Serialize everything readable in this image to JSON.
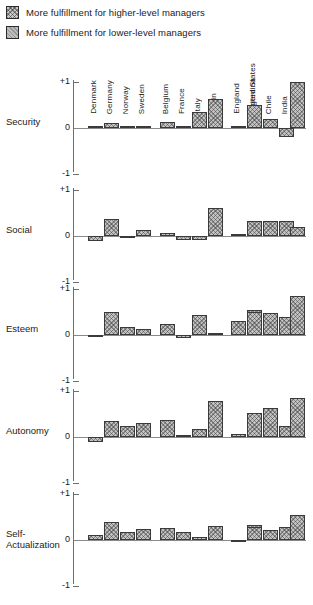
{
  "legend": {
    "items": [
      {
        "label": "More fulfillment for higher-level managers",
        "swatch": "hatched-swatch-higher"
      },
      {
        "label": "More fulfillment for lower-level managers",
        "swatch": "hatched-swatch-lower"
      }
    ]
  },
  "chart_data": {
    "type": "bar",
    "title": "",
    "xlabel": "",
    "ylabel": "",
    "ylim": [
      -1,
      1
    ],
    "grid": false,
    "legend_position": "top-left",
    "tick_labels": [
      "+1",
      "0",
      "-1"
    ],
    "country_groups": [
      {
        "name": "Northern Europe",
        "countries": [
          "Denmark",
          "Germany",
          "Norway",
          "Sweden"
        ]
      },
      {
        "name": "Latin Europe",
        "countries": [
          "Belgium",
          "France",
          "Italy",
          "Spain"
        ]
      },
      {
        "name": "Anglo-American",
        "countries": [
          "England",
          "United States"
        ]
      },
      {
        "name": "Developing",
        "countries": [
          "Argentina",
          "Chile",
          "India"
        ]
      },
      {
        "name": "Japan",
        "countries": [
          "Japan"
        ]
      }
    ],
    "categories": [
      "Denmark",
      "Germany",
      "Norway",
      "Sweden",
      "Belgium",
      "France",
      "Italy",
      "Spain",
      "England",
      "United States",
      "Argentina",
      "Chile",
      "India",
      "Japan"
    ],
    "panels": [
      {
        "label": "Security",
        "values": [
          0.02,
          0.1,
          0.03,
          0.02,
          0.12,
          0.01,
          0.35,
          0.62,
          0.04,
          0.27,
          0.5,
          0.2,
          -0.2,
          1.0
        ]
      },
      {
        "label": "Social",
        "values": [
          -0.1,
          0.38,
          -0.04,
          0.14,
          0.07,
          -0.08,
          -0.09,
          0.6,
          0.03,
          0.12,
          0.33,
          0.33,
          0.33,
          0.2
        ]
      },
      {
        "label": "Esteem",
        "values": [
          -0.05,
          0.5,
          0.18,
          0.13,
          0.25,
          -0.06,
          0.44,
          0.0,
          0.3,
          0.55,
          0.5,
          0.48,
          0.4,
          0.85
        ]
      },
      {
        "label": "Autonomy",
        "values": [
          -0.1,
          0.35,
          0.25,
          0.3,
          0.37,
          0.05,
          0.18,
          0.78,
          0.07,
          0.33,
          0.52,
          0.62,
          0.25,
          0.85
        ]
      },
      {
        "label": "Self-\nActualization",
        "values": [
          0.1,
          0.4,
          0.17,
          0.25,
          0.27,
          0.18,
          0.06,
          0.3,
          -0.05,
          0.32,
          0.28,
          0.22,
          0.28,
          0.55
        ]
      }
    ]
  },
  "geometry": {
    "panel_tops": [
      74,
      182,
      281,
      383,
      486
    ],
    "panel_height": 98,
    "unit_px": 46,
    "bar_width": 15,
    "bar_x": [
      88,
      104,
      120,
      136,
      160,
      176,
      192,
      208,
      231,
      247,
      247,
      263,
      279,
      290
    ]
  }
}
